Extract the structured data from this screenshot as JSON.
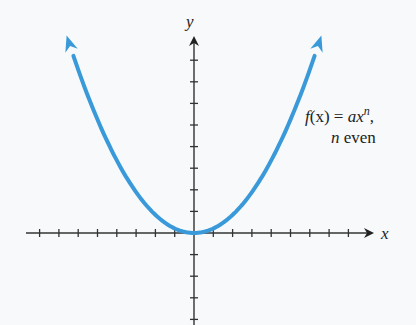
{
  "figure": {
    "axes": {
      "x_label": "x",
      "y_label": "y",
      "origin_px": [
        194,
        233
      ],
      "x_tick_spacing_px": 19.3,
      "y_tick_spacing_px": 21.6,
      "x_ticks": [
        -8,
        -7,
        -6,
        -5,
        -4,
        -3,
        -2,
        -1,
        1,
        2,
        3,
        4,
        5,
        6,
        7,
        8
      ],
      "y_ticks": [
        -4,
        -3,
        -2,
        -1,
        1,
        2,
        3,
        4,
        5,
        6,
        7,
        8
      ]
    },
    "curve": {
      "function": "f(x) = ax^n",
      "color": "#3a9ad9",
      "shape": "parabola-like, opening upward, vertex at origin, arrows at both ends"
    },
    "annotation": {
      "line1_f": "f",
      "line1_paren": "(x) = ",
      "line1_ax": "ax",
      "line1_n": "n",
      "line1_comma": ",",
      "line2_n": "n",
      "line2_even": " even"
    }
  },
  "chart_data": {
    "type": "line",
    "title": "",
    "xlabel": "x",
    "ylabel": "y",
    "series": [
      {
        "name": "f(x) = ax^n, n even",
        "x": [
          -6.6,
          -6,
          -5,
          -4,
          -3,
          -2,
          -1,
          0,
          1,
          2,
          3,
          4,
          5,
          6,
          6.6
        ],
        "values": [
          9.1,
          7.6,
          5.3,
          3.4,
          1.9,
          0.84,
          0.21,
          0,
          0.21,
          0.84,
          1.9,
          3.4,
          5.3,
          7.6,
          9.1
        ]
      }
    ],
    "xlim": [
      -8,
      9
    ],
    "ylim": [
      -4,
      9
    ],
    "grid": false,
    "annotations": [
      "f(x) = ax^n,",
      "n even"
    ]
  }
}
